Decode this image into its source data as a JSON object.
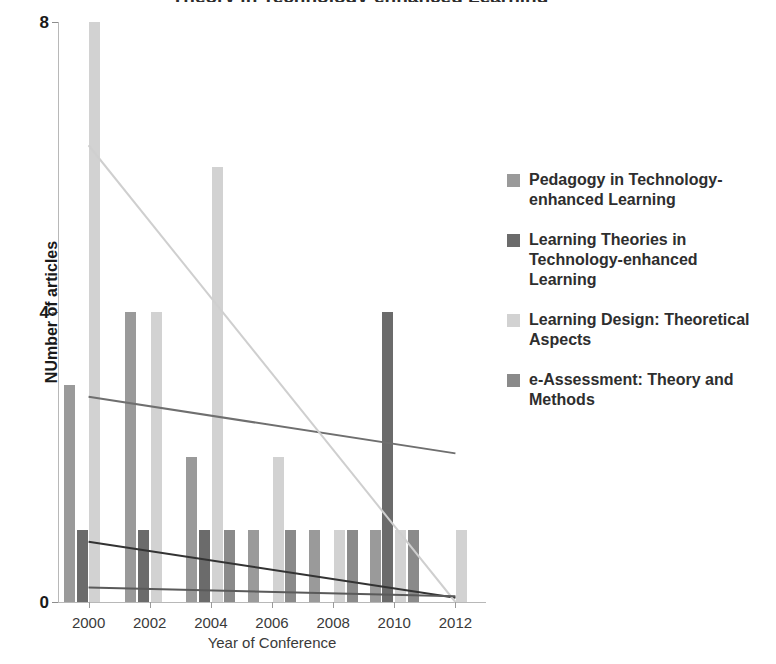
{
  "chart_data": {
    "type": "bar",
    "title": "Theory in Technology-enhanced Learning",
    "xlabel": "Year of Conference",
    "ylabel": "NUmber of articles",
    "categories": [
      2000,
      2002,
      2004,
      2006,
      2008,
      2010,
      2012
    ],
    "xtick_labels": [
      "2000",
      "2002",
      "2004",
      "2006",
      "2008",
      "2010",
      "2012"
    ],
    "ytick_labels": [
      "0",
      "4",
      "8"
    ],
    "yticks": [
      0,
      4,
      8
    ],
    "ylim": [
      0,
      8
    ],
    "xlim": [
      1999,
      2013
    ],
    "grid": false,
    "legend_position": "right",
    "series": [
      {
        "name": "Pedagogy in Technology-enhanced Learning",
        "color": "#9a9a9a",
        "values": [
          3,
          4,
          2,
          1,
          1,
          1,
          0
        ],
        "trendline": {
          "start": 2.83,
          "end": 2.05,
          "color": "#6f6f6f"
        }
      },
      {
        "name": "Learning Theories in Technology-enhanced Learning",
        "color": "#6b6b6b",
        "values": [
          1,
          1,
          1,
          0,
          0,
          4,
          0
        ],
        "trendline": {
          "start": 0.83,
          "end": 0.06,
          "color": "#333333"
        }
      },
      {
        "name": "Learning Design: Theoretical Aspects",
        "color": "#d2d2d2",
        "values": [
          8,
          4,
          6,
          2,
          1,
          1,
          1
        ],
        "trendline": {
          "start": 6.3,
          "end": 0.0,
          "color": "#cfcfcf"
        }
      },
      {
        "name": "e-Assessment: Theory and Methods",
        "color": "#8a8a8a",
        "values": [
          0,
          0,
          1,
          1,
          1,
          1,
          0
        ],
        "trendline": {
          "start": 0.2,
          "end": 0.08,
          "color": "#5a5a5a"
        }
      }
    ]
  },
  "legend": {
    "items": [
      {
        "label": "Pedagogy in Technology-enhanced Learning",
        "color": "#9a9a9a"
      },
      {
        "label": "Learning Theories in Technology-enhanced Learning",
        "color": "#6b6b6b"
      },
      {
        "label": "Learning Design: Theoretical Aspects",
        "color": "#d2d2d2"
      },
      {
        "label": "e-Assessment: Theory and Methods",
        "color": "#8a8a8a"
      }
    ]
  },
  "axes": {
    "x_title": "Year of Conference",
    "y_title": "NUmber of articles"
  }
}
